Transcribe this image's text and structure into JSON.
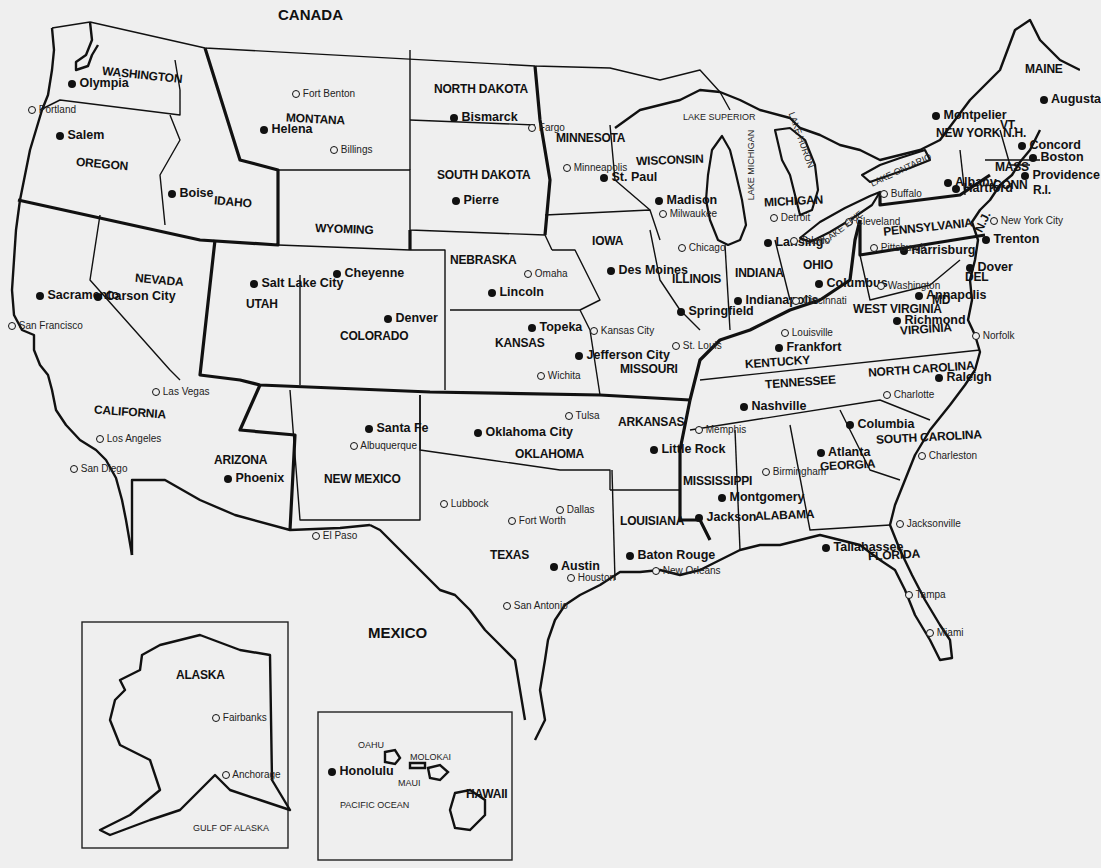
{
  "map": {
    "title": "United States",
    "regions": {
      "canada": "CANADA",
      "mexico": "MEXICO"
    },
    "states": [
      {
        "id": "washington",
        "label": "WASHINGTON"
      },
      {
        "id": "oregon",
        "label": "OREGON"
      },
      {
        "id": "idaho",
        "label": "IDAHO"
      },
      {
        "id": "montana",
        "label": "MONTANA"
      },
      {
        "id": "wyoming",
        "label": "WYOMING"
      },
      {
        "id": "nevada",
        "label": "NEVADA"
      },
      {
        "id": "california",
        "label": "CALIFORNIA"
      },
      {
        "id": "utah",
        "label": "UTAH"
      },
      {
        "id": "colorado",
        "label": "COLORADO"
      },
      {
        "id": "arizona",
        "label": "ARIZONA"
      },
      {
        "id": "new-mexico",
        "label": "NEW MEXICO"
      },
      {
        "id": "north-dakota",
        "label": "NORTH DAKOTA"
      },
      {
        "id": "south-dakota",
        "label": "SOUTH DAKOTA"
      },
      {
        "id": "nebraska",
        "label": "NEBRASKA"
      },
      {
        "id": "kansas",
        "label": "KANSAS"
      },
      {
        "id": "oklahoma",
        "label": "OKLAHOMA"
      },
      {
        "id": "texas",
        "label": "TEXAS"
      },
      {
        "id": "minnesota",
        "label": "MINNESOTA"
      },
      {
        "id": "iowa",
        "label": "IOWA"
      },
      {
        "id": "missouri",
        "label": "MISSOURI"
      },
      {
        "id": "arkansas",
        "label": "ARKANSAS"
      },
      {
        "id": "louisiana",
        "label": "LOUISIANA"
      },
      {
        "id": "wisconsin",
        "label": "WISCONSIN"
      },
      {
        "id": "illinois",
        "label": "ILLINOIS"
      },
      {
        "id": "michigan",
        "label": "MICHIGAN"
      },
      {
        "id": "indiana",
        "label": "INDIANA"
      },
      {
        "id": "ohio",
        "label": "OHIO"
      },
      {
        "id": "kentucky",
        "label": "KENTUCKY"
      },
      {
        "id": "tennessee",
        "label": "TENNESSEE"
      },
      {
        "id": "mississippi",
        "label": "MISSISSIPPI"
      },
      {
        "id": "alabama",
        "label": "ALABAMA"
      },
      {
        "id": "georgia",
        "label": "GEORGIA"
      },
      {
        "id": "florida",
        "label": "FLORIDA"
      },
      {
        "id": "south-carolina",
        "label": "SOUTH CAROLINA"
      },
      {
        "id": "north-carolina",
        "label": "NORTH CAROLINA"
      },
      {
        "id": "virginia",
        "label": "VIRGINIA"
      },
      {
        "id": "west-virginia",
        "label": "WEST VIRGINIA"
      },
      {
        "id": "pennsylvania",
        "label": "PENNSYLVANIA"
      },
      {
        "id": "new-york",
        "label": "NEW YORK"
      },
      {
        "id": "vermont",
        "label": "VT."
      },
      {
        "id": "new-hampshire",
        "label": "N.H."
      },
      {
        "id": "maine",
        "label": "MAINE"
      },
      {
        "id": "massachusetts",
        "label": "MASS"
      },
      {
        "id": "connecticut",
        "label": "CONN"
      },
      {
        "id": "rhode-island",
        "label": "R.I."
      },
      {
        "id": "new-jersey",
        "label": "N.J."
      },
      {
        "id": "delaware",
        "label": "DEL"
      },
      {
        "id": "maryland",
        "label": "MD"
      },
      {
        "id": "alaska",
        "label": "ALASKA"
      },
      {
        "id": "hawaii",
        "label": "HAWAII"
      }
    ],
    "capitals": [
      "Olympia",
      "Salem",
      "Boise",
      "Helena",
      "Cheyenne",
      "Carson City",
      "Sacramento",
      "Salt Lake City",
      "Denver",
      "Phoenix",
      "Santa Fe",
      "Bismarck",
      "Pierre",
      "Lincoln",
      "Topeka",
      "Oklahoma City",
      "Austin",
      "St. Paul",
      "Des Moines",
      "Jefferson City",
      "Little Rock",
      "Baton Rouge",
      "Madison",
      "Springfield",
      "Lansing",
      "Indianapolis",
      "Columbus",
      "Frankfort",
      "Nashville",
      "Jackson",
      "Montgomery",
      "Atlanta",
      "Tallahassee",
      "Columbia",
      "Raleigh",
      "Richmond",
      "Annapolis",
      "Harrisburg",
      "Albany",
      "Montpelier",
      "Concord",
      "Augusta",
      "Boston",
      "Hartford",
      "Providence",
      "Trenton",
      "Dover",
      "Honolulu"
    ],
    "cities": [
      "Portland",
      "Fort Benton",
      "Billings",
      "Fargo",
      "Minneapolis",
      "Milwaukee",
      "Chicago",
      "Detroit",
      "Toledo",
      "Cleveland",
      "Buffalo",
      "Pittsburgh",
      "Cincinnati",
      "Louisville",
      "St. Louis",
      "Kansas City",
      "Omaha",
      "Wichita",
      "Tulsa",
      "Memphis",
      "Birmingham",
      "Charlotte",
      "Charleston",
      "Norfolk",
      "Washington",
      "New York City",
      "Jacksonville",
      "Tampa",
      "Miami",
      "New Orleans",
      "Houston",
      "San Antonio",
      "Dallas",
      "Fort Worth",
      "Lubbock",
      "El Paso",
      "Albuquerque",
      "Las Vegas",
      "Los Angeles",
      "San Diego",
      "San Francisco",
      "Fairbanks",
      "Anchorage"
    ],
    "water": {
      "lake_superior": "LAKE SUPERIOR",
      "lake_michigan": "LAKE MICHIGAN",
      "lake_huron": "LAKE HURON",
      "lake_erie": "LAKE ERIE",
      "lake_ontario": "LAKE ONTARIO",
      "gulf_of_alaska": "GULF OF ALASKA",
      "pacific_ocean": "PACIFIC OCEAN"
    },
    "islands": {
      "oahu": "OAHU",
      "molokai": "MOLOKAI",
      "maui": "MAUI"
    },
    "legend": {
      "capital_marker": "filled-dot",
      "city_marker": "open-circle"
    }
  }
}
